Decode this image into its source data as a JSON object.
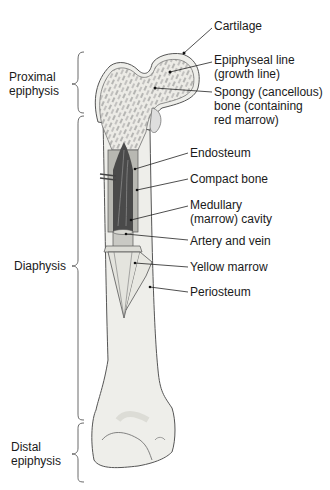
{
  "diagram": {
    "regions": [
      {
        "id": "proximal",
        "label": "Proximal\nepiphysis"
      },
      {
        "id": "diaphysis",
        "label": "Diaphysis"
      },
      {
        "id": "distal",
        "label": "Distal\nepiphysis"
      }
    ],
    "callouts": [
      {
        "id": "cartilage",
        "label": "Cartilage"
      },
      {
        "id": "epiphyseal-line",
        "label": "Epiphyseal line\n(growth line)"
      },
      {
        "id": "spongy-bone",
        "label": "Spongy (cancellous)\nbone (containing\nred marrow)"
      },
      {
        "id": "endosteum",
        "label": "Endosteum"
      },
      {
        "id": "compact-bone",
        "label": "Compact bone"
      },
      {
        "id": "medullary-cavity",
        "label": "Medullary\n(marrow) cavity"
      },
      {
        "id": "artery-vein",
        "label": "Artery and vein"
      },
      {
        "id": "yellow-marrow",
        "label": "Yellow marrow"
      },
      {
        "id": "periosteum",
        "label": "Periosteum"
      }
    ],
    "colors": {
      "bone_fill": "#eeeeea",
      "bone_outline": "#555555",
      "spongy_texture": "#8a8a8a",
      "marrow_dark": "#4a4a4a",
      "yellow_marrow": "#c9c9c4",
      "text": "#1a1a1a"
    }
  }
}
